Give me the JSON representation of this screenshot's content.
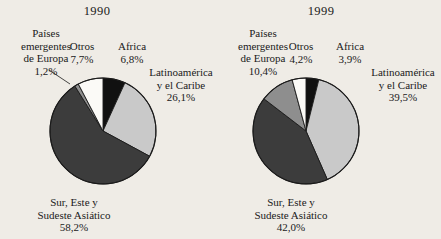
{
  "figure": {
    "background_color": "#efece6",
    "ink_color": "#1a1a1a"
  },
  "palette": {
    "africa": "#111111",
    "latinoamerica": "#c9c9c9",
    "asia": "#3c3c3c",
    "europa_emergente": "#8e8e8e",
    "otros": "#fbfaf7",
    "outline": "#1a1a1a"
  },
  "panels": [
    {
      "id": "panel-1990",
      "year": "1990",
      "labels": {
        "europa_name": "Países\nemergentes\nde Europa",
        "europa_line1": "Países",
        "europa_line2": "emergentes",
        "europa_line3": "de Europa",
        "europa_pct": "1,2%",
        "otros_name": "Otros",
        "otros_pct": "7,7%",
        "africa_name": "Africa",
        "africa_pct": "6,8%",
        "latin_line1": "Latinoamérica",
        "latin_line2": "y el Caribe",
        "latin_pct": "26,1%",
        "asia_line1": "Sur, Este y",
        "asia_line2": "Sudeste Asiático",
        "asia_pct": "58,2%"
      }
    },
    {
      "id": "panel-1999",
      "year": "1999",
      "labels": {
        "europa_line1": "Países",
        "europa_line2": "emergentes",
        "europa_line3": "de Europa",
        "europa_pct": "10,4%",
        "otros_name": "Otros",
        "otros_pct": "4,2%",
        "africa_name": "Africa",
        "africa_pct": "3,9%",
        "latin_line1": "Latinoamérica",
        "latin_line2": "y el Caribe",
        "latin_pct": "39,5%",
        "asia_line1": "Sur, Este y",
        "asia_line2": "Sudeste Asiático",
        "asia_pct": "42,0%"
      }
    }
  ],
  "chart_data": [
    {
      "type": "pie",
      "title": "1990",
      "units": "percent",
      "start_angle_deg": 0,
      "direction": "clockwise",
      "categories": [
        "Africa",
        "Latinoamérica y el Caribe",
        "Sur, Este y Sudeste Asiático",
        "Países emergentes de Europa",
        "Otros"
      ],
      "values": [
        6.8,
        26.1,
        58.2,
        1.2,
        7.7
      ],
      "value_labels": [
        "6,8%",
        "26,1%",
        "58,2%",
        "1,2%",
        "7,7%"
      ],
      "colors": [
        "#111111",
        "#c9c9c9",
        "#3c3c3c",
        "#8e8e8e",
        "#fbfaf7"
      ],
      "legend": "none",
      "grid": false
    },
    {
      "type": "pie",
      "title": "1999",
      "units": "percent",
      "start_angle_deg": 0,
      "direction": "clockwise",
      "categories": [
        "Africa",
        "Latinoamérica y el Caribe",
        "Sur, Este y Sudeste Asiático",
        "Países emergentes de Europa",
        "Otros"
      ],
      "values": [
        3.9,
        39.5,
        42.0,
        10.4,
        4.2
      ],
      "value_labels": [
        "3,9%",
        "39,5%",
        "42,0%",
        "10,4%",
        "4,2%"
      ],
      "colors": [
        "#111111",
        "#c9c9c9",
        "#3c3c3c",
        "#8e8e8e",
        "#fbfaf7"
      ],
      "legend": "none",
      "grid": false
    }
  ]
}
